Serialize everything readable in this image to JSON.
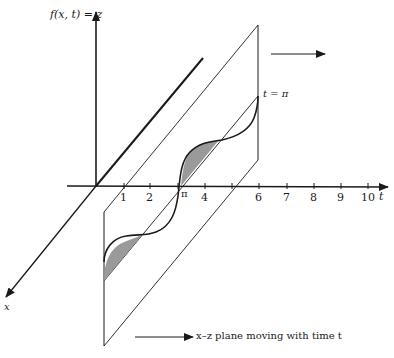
{
  "axes": {
    "z_label": "f(x, t) = z",
    "t_label": "t",
    "x_label": "x",
    "t_ticks": [
      {
        "label": "1",
        "x": 124
      },
      {
        "label": "2",
        "x": 150
      },
      {
        "label": "π",
        "x": 181
      },
      {
        "label": "4",
        "x": 205
      },
      {
        "label": "",
        "x": 232
      },
      {
        "label": "6",
        "x": 259
      },
      {
        "label": "7",
        "x": 287
      },
      {
        "label": "8",
        "x": 314
      },
      {
        "label": "9",
        "x": 341
      },
      {
        "label": "10",
        "x": 368
      }
    ]
  },
  "plane": {
    "time_label": "t = π",
    "caption": "x–z plane moving with time t"
  },
  "colors": {
    "ink": "#1a1a1a",
    "shade": "#9a9a9a",
    "background": "#ffffff"
  }
}
